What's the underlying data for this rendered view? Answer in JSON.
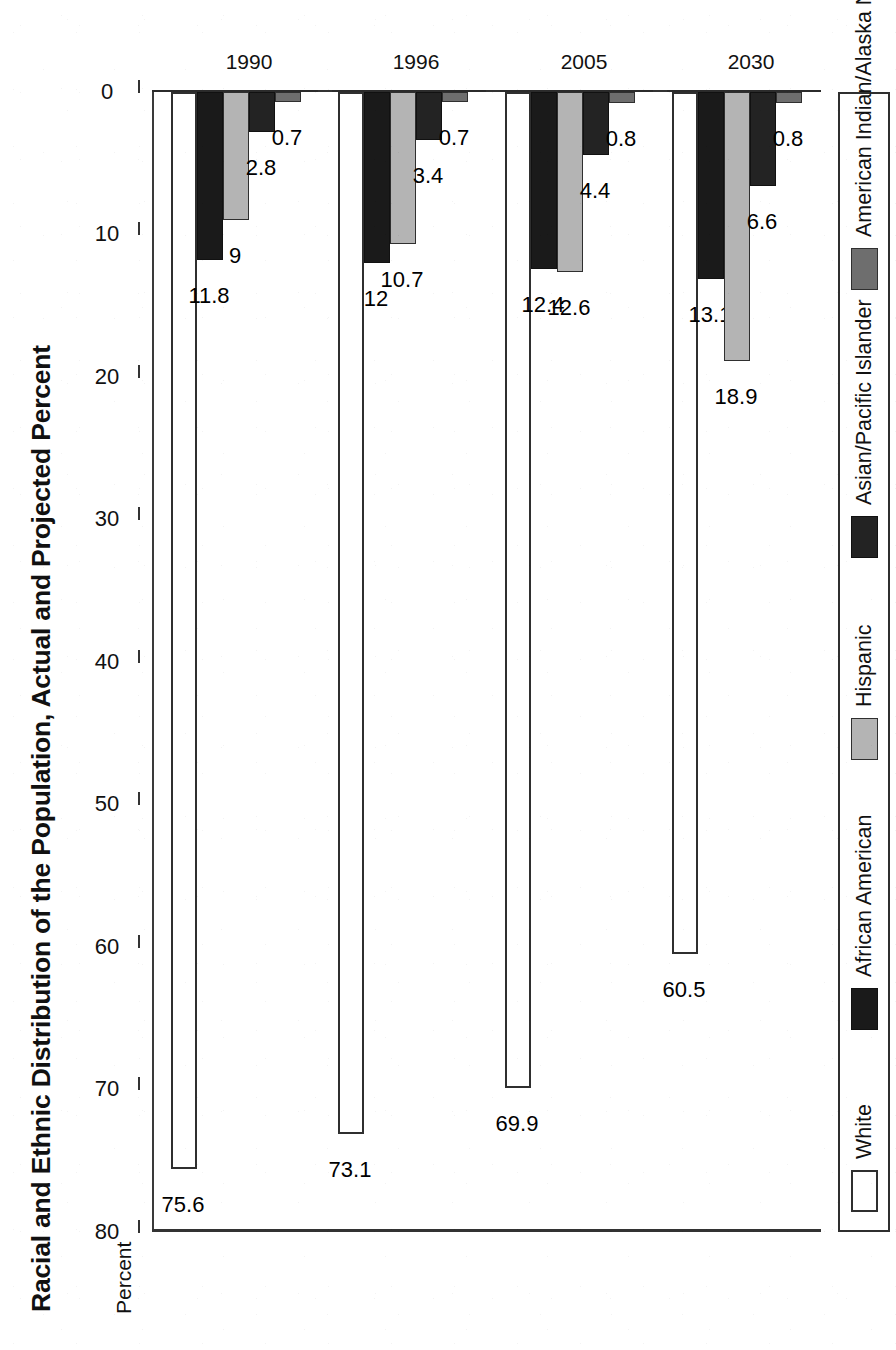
{
  "chart_data": {
    "type": "bar",
    "title": "Racial and Ethnic Distribution of the Population, Actual and Projected Percent",
    "orientation": "horizontal-rotated",
    "xlabel": "",
    "ylabel": "Percent",
    "axis_label": "Percent",
    "ylim": [
      0,
      80
    ],
    "ticks": [
      80,
      70,
      60,
      50,
      40,
      30,
      20,
      10,
      0
    ],
    "tick_labels": [
      "80",
      "70",
      "60",
      "50",
      "40",
      "30",
      "20",
      "10",
      "0"
    ],
    "grid": false,
    "legend_position": "bottom",
    "categories": [
      "1990",
      "1996",
      "2005",
      "2030"
    ],
    "series": [
      {
        "name": "White",
        "color": "#ffffff",
        "swatch_class": "sw-white",
        "bar_class": "ser-white",
        "values": [
          75.6,
          73.1,
          69.9,
          60.5
        ],
        "labels": [
          "75.6",
          "73.1",
          "69.9",
          "60.5"
        ]
      },
      {
        "name": "African American",
        "color": "#1a1a1a",
        "swatch_class": "sw-black",
        "bar_class": "ser-black",
        "values": [
          11.8,
          12,
          12.4,
          13.1
        ],
        "labels": [
          "11.8",
          "12",
          "12.4",
          "13.1"
        ]
      },
      {
        "name": "Hispanic",
        "color": "#b4b4b4",
        "swatch_class": "sw-ltgray",
        "bar_class": "ser-ltgray",
        "values": [
          9,
          10.7,
          12.6,
          18.9
        ],
        "labels": [
          "9",
          "10.7",
          "12.6",
          "18.9"
        ]
      },
      {
        "name": "Asian/Pacific Islander",
        "color": "#232323",
        "swatch_class": "sw-dark",
        "bar_class": "ser-dark",
        "values": [
          2.8,
          3.4,
          4.4,
          6.6
        ],
        "labels": [
          "2.8",
          "3.4",
          "4.4",
          "6.6"
        ]
      },
      {
        "name": "American Indian/Alaska Native",
        "color": "#6e6e6e",
        "swatch_class": "sw-mdgray",
        "bar_class": "ser-mdgray",
        "values": [
          0.7,
          0.7,
          0.8,
          0.8
        ],
        "labels": [
          "0.7",
          "0.7",
          "0.8",
          "0.8"
        ]
      }
    ]
  },
  "footnote": {
    "text": "… Hispanic origin.  “Pacific Islanders,” American Indian/Alas…"
  }
}
